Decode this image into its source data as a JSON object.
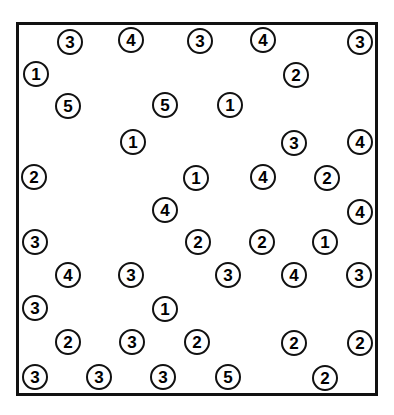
{
  "figure": {
    "name": "numbered-marker-scatter",
    "width": 394,
    "height": 415,
    "background_color": "#ffffff"
  },
  "plot_frame": {
    "x": 16,
    "y": 22,
    "width": 362,
    "height": 374,
    "border_color": "#111111",
    "border_width": 3,
    "fill_color": "#ffffff"
  },
  "marker_style": {
    "diameter": 26,
    "border_color": "#111111",
    "border_width": 2.5,
    "fill_color": "#ffffff",
    "text_color": "#000000",
    "font_size": 17
  },
  "chart_data": {
    "type": "scatter",
    "title": "",
    "xlabel": "",
    "ylabel": "",
    "xlim": [
      16,
      378
    ],
    "ylim": [
      22,
      396
    ],
    "grid": false,
    "legend": null,
    "point_label_kind": "circled-number",
    "categories": [
      "1",
      "2",
      "3",
      "4",
      "5"
    ],
    "category_counts": {
      "1": 8,
      "2": 13,
      "3": 14,
      "4": 7,
      "5": 3
    },
    "total_points": 45,
    "points": [
      {
        "label": "3",
        "x": 70,
        "y": 42
      },
      {
        "label": "4",
        "x": 131,
        "y": 40
      },
      {
        "label": "3",
        "x": 200,
        "y": 41
      },
      {
        "label": "4",
        "x": 263,
        "y": 40
      },
      {
        "label": "3",
        "x": 360,
        "y": 42
      },
      {
        "label": "1",
        "x": 36,
        "y": 74
      },
      {
        "label": "2",
        "x": 296,
        "y": 75
      },
      {
        "label": "5",
        "x": 68,
        "y": 106
      },
      {
        "label": "5",
        "x": 165,
        "y": 105
      },
      {
        "label": "1",
        "x": 230,
        "y": 105
      },
      {
        "label": "1",
        "x": 133,
        "y": 142
      },
      {
        "label": "3",
        "x": 294,
        "y": 143
      },
      {
        "label": "4",
        "x": 360,
        "y": 142
      },
      {
        "label": "2",
        "x": 34,
        "y": 177
      },
      {
        "label": "1",
        "x": 196,
        "y": 178
      },
      {
        "label": "4",
        "x": 263,
        "y": 177
      },
      {
        "label": "2",
        "x": 327,
        "y": 178
      },
      {
        "label": "4",
        "x": 165,
        "y": 210
      },
      {
        "label": "4",
        "x": 360,
        "y": 212
      },
      {
        "label": "3",
        "x": 35,
        "y": 242
      },
      {
        "label": "2",
        "x": 198,
        "y": 242
      },
      {
        "label": "2",
        "x": 262,
        "y": 242
      },
      {
        "label": "1",
        "x": 325,
        "y": 242
      },
      {
        "label": "4",
        "x": 68,
        "y": 275
      },
      {
        "label": "3",
        "x": 131,
        "y": 275
      },
      {
        "label": "3",
        "x": 228,
        "y": 275
      },
      {
        "label": "4",
        "x": 294,
        "y": 275
      },
      {
        "label": "3",
        "x": 359,
        "y": 275
      },
      {
        "label": "3",
        "x": 35,
        "y": 308
      },
      {
        "label": "1",
        "x": 165,
        "y": 309
      },
      {
        "label": "2",
        "x": 68,
        "y": 342
      },
      {
        "label": "3",
        "x": 132,
        "y": 342
      },
      {
        "label": "2",
        "x": 197,
        "y": 342
      },
      {
        "label": "2",
        "x": 294,
        "y": 343
      },
      {
        "label": "2",
        "x": 360,
        "y": 343
      },
      {
        "label": "3",
        "x": 35,
        "y": 377
      },
      {
        "label": "3",
        "x": 99,
        "y": 377
      },
      {
        "label": "3",
        "x": 163,
        "y": 377
      },
      {
        "label": "5",
        "x": 228,
        "y": 377
      },
      {
        "label": "2",
        "x": 325,
        "y": 378
      }
    ]
  }
}
